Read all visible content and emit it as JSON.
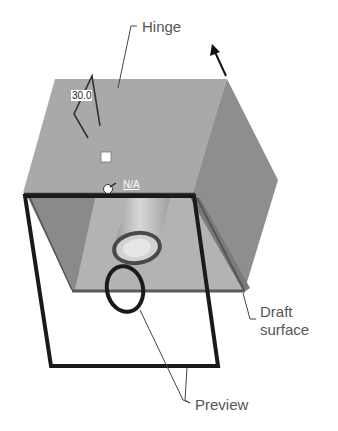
{
  "diagram": {
    "type": "cad-draft-feature",
    "labels": {
      "hinge": "Hinge",
      "draft_surface_line1": "Draft",
      "draft_surface_line2": "surface",
      "preview": "Preview"
    },
    "annotations": {
      "draft_angle": "30.0",
      "neutral_value": "N/A"
    },
    "colors": {
      "top_face": "#a9a9a9",
      "side_face": "#8e8e8e",
      "inner_face_left": "#8a8a8a",
      "inner_face_bottom": "#b3b3b3",
      "preview_outline": "#1a1a1a",
      "leader_line": "#444444",
      "label_text": "#555555"
    }
  }
}
